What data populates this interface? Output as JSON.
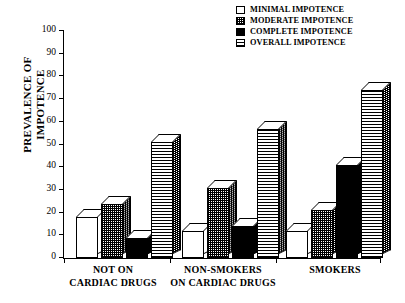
{
  "chart_data": {
    "type": "bar",
    "title": "",
    "xlabel": "",
    "ylabel": "PREVALENCE OF IMPOTENCE",
    "ylabel_lines": [
      "PREVALENCE OF",
      "IMPOTENCE"
    ],
    "ylim": [
      0,
      100
    ],
    "yticks": [
      0,
      10,
      20,
      30,
      40,
      50,
      60,
      70,
      80,
      90,
      100
    ],
    "ytick_labels": [
      "0",
      "10",
      "20",
      "30",
      "40",
      "50",
      "60",
      "70",
      "80",
      "90",
      "100"
    ],
    "grid": false,
    "legend_position": "top-right",
    "categories": [
      "NOT ON CARDIAC DRUGS",
      "NON-SMOKERS",
      "SMOKERS"
    ],
    "category_lines": [
      [
        "NOT ON",
        "CARDIAC DRUGS"
      ],
      [
        "NON-SMOKERS",
        ""
      ],
      [
        "SMOKERS",
        ""
      ]
    ],
    "category_group_note": "ON  CARDIAC DRUGS",
    "series": [
      {
        "name": "MINIMAL IMPOTENCE",
        "pattern": "white",
        "values": [
          18,
          12,
          12
        ]
      },
      {
        "name": "MODERATE IMPOTENCE",
        "pattern": "checkered",
        "values": [
          24,
          31,
          21
        ]
      },
      {
        "name": "COMPLETE IMPOTENCE",
        "pattern": "solid-black",
        "values": [
          9,
          14,
          41
        ]
      },
      {
        "name": "OVERALL IMPOTENCE",
        "pattern": "horiz-stripe",
        "values": [
          51,
          57,
          74
        ]
      }
    ]
  },
  "legend": {
    "items": [
      {
        "label": "MINIMAL IMPOTENCE",
        "swatch": "fill-minimal"
      },
      {
        "label": "MODERATE IMPOTENCE",
        "swatch": "fill-moderate"
      },
      {
        "label": "COMPLETE IMPOTENCE",
        "swatch": "fill-complete"
      },
      {
        "label": "OVERALL IMPOTENCE",
        "swatch": "fill-overall"
      }
    ]
  },
  "axis": {
    "y_label_line1": "PREVALENCE OF",
    "y_label_line2": "IMPOTENCE"
  },
  "categories_display": {
    "g0_line1": "NOT ON",
    "g0_line2": "CARDIAC DRUGS",
    "g1_line1": "NON-SMOKERS",
    "g1_line2": "ON  CARDIAC DRUGS",
    "g2_line1": "SMOKERS"
  },
  "caption_partial": ""
}
